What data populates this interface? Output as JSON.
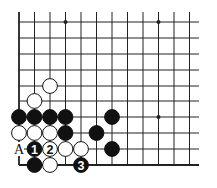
{
  "diagram": {
    "type": "go-board-fragment",
    "corner": "bottom-left",
    "grid": {
      "columns": 12,
      "rows": 10,
      "col_x": [
        19,
        34.5,
        50,
        65.5,
        81,
        96.5,
        112,
        127.5,
        143,
        158.5,
        174,
        189.5
      ],
      "row_y": [
        22,
        38,
        54,
        70,
        86,
        101,
        117,
        133,
        149,
        165
      ],
      "line_extend_top": 12,
      "line_extend_right": 199
    },
    "star_points": [
      {
        "col": 3,
        "row": 0
      },
      {
        "col": 9,
        "row": 0
      },
      {
        "col": 9,
        "row": 6
      }
    ],
    "stones": [
      {
        "color": "white",
        "col": 2,
        "row": 4,
        "label": ""
      },
      {
        "color": "white",
        "col": 1,
        "row": 5,
        "label": ""
      },
      {
        "color": "black",
        "col": 0,
        "row": 6,
        "label": ""
      },
      {
        "color": "black",
        "col": 1,
        "row": 6,
        "label": ""
      },
      {
        "color": "black",
        "col": 2,
        "row": 6,
        "label": ""
      },
      {
        "color": "black",
        "col": 3,
        "row": 6,
        "label": ""
      },
      {
        "color": "black",
        "col": 6,
        "row": 6,
        "label": ""
      },
      {
        "color": "white",
        "col": 0,
        "row": 7,
        "label": ""
      },
      {
        "color": "white",
        "col": 1,
        "row": 7,
        "label": ""
      },
      {
        "color": "white",
        "col": 2,
        "row": 7,
        "label": ""
      },
      {
        "color": "black",
        "col": 3,
        "row": 7,
        "label": ""
      },
      {
        "color": "black",
        "col": 5,
        "row": 7,
        "label": ""
      },
      {
        "color": "black",
        "col": 1,
        "row": 8,
        "label": "1"
      },
      {
        "color": "white",
        "col": 2,
        "row": 8,
        "label": "2"
      },
      {
        "color": "white",
        "col": 3,
        "row": 8,
        "label": ""
      },
      {
        "color": "white",
        "col": 4,
        "row": 8,
        "label": ""
      },
      {
        "color": "black",
        "col": 6,
        "row": 8,
        "label": ""
      },
      {
        "color": "black",
        "col": 1,
        "row": 9,
        "label": ""
      },
      {
        "color": "white",
        "col": 2,
        "row": 9,
        "label": ""
      },
      {
        "color": "black",
        "col": 4,
        "row": 9,
        "label": "3"
      }
    ],
    "point_labels": [
      {
        "text": "A",
        "col": 0,
        "row": 8
      }
    ],
    "colors": {
      "line": "#222222",
      "black_stone": "#111111",
      "white_stone": "#ffffff",
      "background": "#ffffff"
    }
  }
}
